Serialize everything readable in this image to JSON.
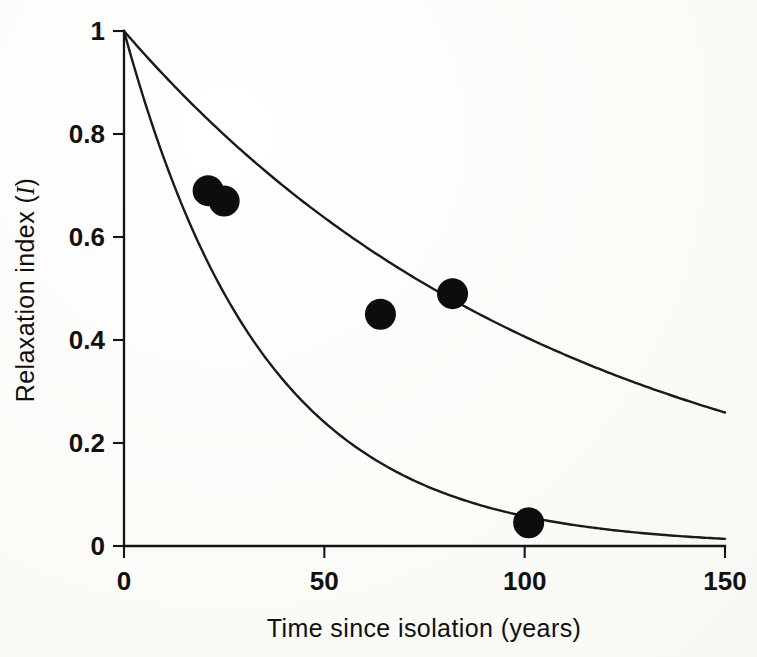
{
  "figure": {
    "background_color": "#fdfdfb",
    "ink_color": "#121212"
  },
  "chart_data": {
    "type": "scatter",
    "title": "",
    "xlabel": "Time since isolation (years)",
    "ylabel_text": "Relaxation index (",
    "ylabel_symbol": "I",
    "ylabel_close": ")",
    "xlim": [
      0,
      150
    ],
    "ylim": [
      0,
      1
    ],
    "grid": false,
    "legend": "none",
    "xticks": [
      0,
      50,
      100,
      150
    ],
    "xticklabels": [
      "0",
      "50",
      "100",
      "150"
    ],
    "yticks": [
      0,
      0.2,
      0.4,
      0.6,
      0.8,
      1
    ],
    "yticklabels": [
      "0",
      "0.2",
      "0.4",
      "0.6",
      "0.8",
      "1"
    ],
    "points": {
      "name": "Observed relaxation index",
      "marker": "filled-circle",
      "x": [
        21,
        25,
        64,
        82,
        101
      ],
      "y": [
        0.69,
        0.67,
        0.45,
        0.49,
        0.045
      ]
    },
    "series": [
      {
        "name": "Upper decay curve",
        "type": "line",
        "model": "exponential-decay",
        "decay_rate": 0.009,
        "x": [
          0,
          10,
          20,
          30,
          40,
          50,
          60,
          70,
          80,
          90,
          100,
          110,
          120,
          130,
          140,
          150
        ],
        "values": [
          1.0,
          0.914,
          0.835,
          0.763,
          0.698,
          0.638,
          0.583,
          0.533,
          0.487,
          0.445,
          0.407,
          0.372,
          0.34,
          0.31,
          0.284,
          0.259
        ]
      },
      {
        "name": "Lower decay curve",
        "type": "line",
        "model": "exponential-decay",
        "decay_rate": 0.0285,
        "x": [
          0,
          10,
          20,
          30,
          40,
          50,
          60,
          70,
          80,
          90,
          100,
          110,
          120,
          130,
          140,
          150
        ],
        "values": [
          1.0,
          0.752,
          0.566,
          0.425,
          0.32,
          0.241,
          0.181,
          0.136,
          0.102,
          0.077,
          0.058,
          0.044,
          0.033,
          0.025,
          0.019,
          0.014
        ]
      }
    ]
  }
}
